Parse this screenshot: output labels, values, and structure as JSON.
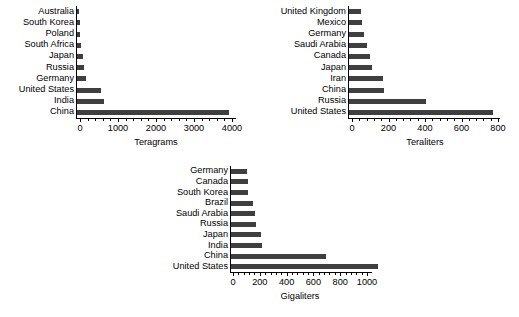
{
  "figure": {
    "background": "#ffffff",
    "bar_color": "#3f3f3f",
    "axis_color": "#000000"
  },
  "chart_data": [
    {
      "id": "teragrams-chart",
      "type": "bar",
      "orientation": "horizontal",
      "title": "",
      "xlabel": "Teragrams",
      "ylabel": "",
      "xlim": [
        0,
        4200
      ],
      "xticks": [
        0,
        1000,
        2000,
        3000,
        4000
      ],
      "xticklabels": [
        "0",
        "1000",
        "2000",
        "3000",
        "4000"
      ],
      "grid": false,
      "legend": null,
      "categories": [
        "Australia",
        "South Korea",
        "Poland",
        "South Africa",
        "Japan",
        "Russia",
        "Germany",
        "United States",
        "India",
        "China"
      ],
      "values": [
        60,
        70,
        90,
        100,
        150,
        180,
        230,
        640,
        720,
        3990
      ]
    },
    {
      "id": "teraliters-chart",
      "type": "bar",
      "orientation": "horizontal",
      "title": "",
      "xlabel": "Teraliters",
      "ylabel": "",
      "xlim": [
        0,
        840
      ],
      "xticks": [
        0,
        200,
        400,
        600,
        800
      ],
      "xticklabels": [
        "0",
        "200",
        "400",
        "600",
        "800"
      ],
      "grid": false,
      "legend": null,
      "categories": [
        "United Kingdom",
        "Mexico",
        "Germany",
        "Saudi Arabia",
        "Canada",
        "Japan",
        "Iran",
        "China",
        "Russia",
        "United States"
      ],
      "values": [
        65,
        70,
        80,
        100,
        115,
        125,
        185,
        190,
        420,
        790
      ]
    },
    {
      "id": "gigaliters-chart",
      "type": "bar",
      "orientation": "horizontal",
      "title": "",
      "xlabel": "Gigaliters",
      "ylabel": "",
      "xlim": [
        0,
        1160
      ],
      "xticks": [
        0,
        200,
        400,
        600,
        800,
        1000
      ],
      "xticklabels": [
        "0",
        "200",
        "400",
        "600",
        "800",
        "1000"
      ],
      "grid": false,
      "legend": null,
      "categories": [
        "Germany",
        "Canada",
        "South Korea",
        "Brazil",
        "Saudi Arabia",
        "Russia",
        "Japan",
        "India",
        "China",
        "United States"
      ],
      "values": [
        120,
        125,
        130,
        165,
        180,
        185,
        225,
        230,
        710,
        1100
      ]
    }
  ],
  "layout": {
    "charts": [
      {
        "id": "teragrams-chart",
        "left": 0,
        "top": 6,
        "label_width": 74,
        "plot_width": 160,
        "plot_height": 112,
        "x0_offset": 4,
        "x_span": 152
      },
      {
        "id": "teraliters-chart",
        "left": 264,
        "top": 6,
        "label_width": 82,
        "plot_width": 152,
        "plot_height": 112,
        "x0_offset": 4,
        "x_span": 146
      },
      {
        "id": "gigaliters-chart",
        "left": 144,
        "top": 166,
        "label_width": 84,
        "plot_width": 142,
        "plot_height": 106,
        "x0_offset": 3,
        "x_span": 134
      }
    ]
  }
}
